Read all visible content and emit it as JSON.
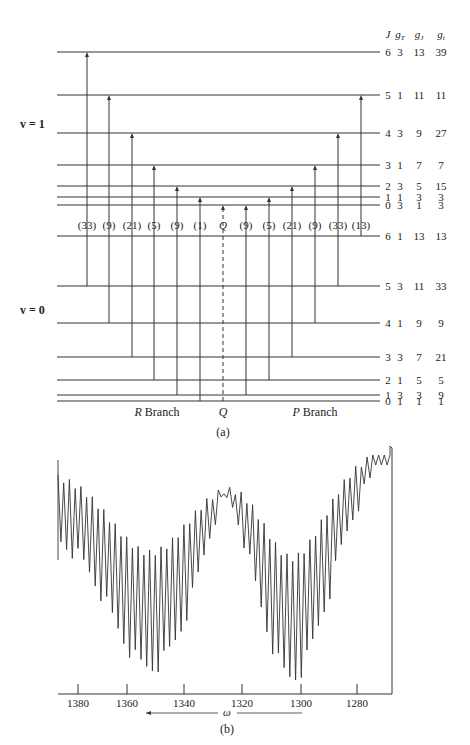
{
  "figure_a": {
    "column_headers": [
      "J",
      "gT",
      "gJ",
      "gt"
    ],
    "upper_state_label": "v = 1",
    "lower_state_label": "v = 0",
    "upper_levels": [
      {
        "J": "6",
        "gT": "3",
        "gJ": "13",
        "gt": "39"
      },
      {
        "J": "5",
        "gT": "1",
        "gJ": "11",
        "gt": "11"
      },
      {
        "J": "4",
        "gT": "3",
        "gJ": "9",
        "gt": "27"
      },
      {
        "J": "3",
        "gT": "1",
        "gJ": "7",
        "gt": "7"
      },
      {
        "J": "2",
        "gT": "3",
        "gJ": "5",
        "gt": "15"
      },
      {
        "J": "1",
        "gT": "1",
        "gJ": "3",
        "gt": "3"
      },
      {
        "J": "0",
        "gT": "3",
        "gJ": "1",
        "gt": "3"
      }
    ],
    "lower_levels": [
      {
        "J": "6",
        "gT": "1",
        "gJ": "13",
        "gt": "13"
      },
      {
        "J": "5",
        "gT": "3",
        "gJ": "11",
        "gt": "33"
      },
      {
        "J": "4",
        "gT": "1",
        "gJ": "9",
        "gt": "9"
      },
      {
        "J": "3",
        "gT": "3",
        "gJ": "7",
        "gt": "21"
      },
      {
        "J": "2",
        "gT": "1",
        "gJ": "5",
        "gt": "5"
      },
      {
        "J": "1",
        "gT": "3",
        "gJ": "3",
        "gt": "9"
      },
      {
        "J": "0",
        "gT": "1",
        "gJ": "1",
        "gt": "1"
      }
    ],
    "transition_labels": [
      "(33)",
      "(9)",
      "(21)",
      "(5)",
      "(9)",
      "(1)",
      "Q",
      "(9)",
      "(5)",
      "(21)",
      "(9)",
      "(33)",
      "(13)"
    ],
    "branch_labels": {
      "r": "R Branch",
      "q": "Q",
      "p": "P Branch"
    },
    "caption": "(a)"
  },
  "figure_b": {
    "x_ticks": [
      "1380",
      "1360",
      "1340",
      "1320",
      "1300",
      "1280"
    ],
    "x_label": "ω",
    "caption": "(b)"
  },
  "chart_data": {
    "type": "line",
    "title": "",
    "xlabel": "ω",
    "ylabel": "",
    "x_ticks": [
      1380,
      1360,
      1340,
      1320,
      1300,
      1280
    ],
    "xlim": [
      1383,
      1268
    ],
    "grid": false,
    "series": [
      {
        "name": "transmission",
        "x": [
          1383,
          1381,
          1379,
          1377,
          1375,
          1373,
          1371,
          1369,
          1367,
          1365,
          1363,
          1361,
          1359,
          1357,
          1355,
          1353,
          1351,
          1349,
          1347,
          1345,
          1343,
          1341,
          1339,
          1337,
          1335,
          1333,
          1331,
          1329,
          1327,
          1325,
          1323,
          1321,
          1319,
          1317,
          1315,
          1313,
          1311,
          1309,
          1307,
          1305,
          1303,
          1301,
          1299,
          1297,
          1295,
          1293,
          1291,
          1289,
          1287,
          1285,
          1283,
          1281,
          1279,
          1277,
          1275,
          1273,
          1271,
          1269
        ],
        "y": [
          0.75,
          0.85,
          0.7,
          0.88,
          0.55,
          0.86,
          0.5,
          0.72,
          0.45,
          0.66,
          0.4,
          0.62,
          0.35,
          0.6,
          0.3,
          0.58,
          0.25,
          0.6,
          0.2,
          0.58,
          0.15,
          0.6,
          0.25,
          0.64,
          0.35,
          0.7,
          0.45,
          0.82,
          0.6,
          0.88,
          0.7,
          0.94,
          0.62,
          0.88,
          0.5,
          0.8,
          0.35,
          0.7,
          0.2,
          0.58,
          0.12,
          0.56,
          0.15,
          0.58,
          0.25,
          0.62,
          0.35,
          0.7,
          0.48,
          0.78,
          0.6,
          0.85,
          0.72,
          0.9,
          0.8,
          0.93,
          0.88,
          0.98
        ]
      }
    ]
  }
}
